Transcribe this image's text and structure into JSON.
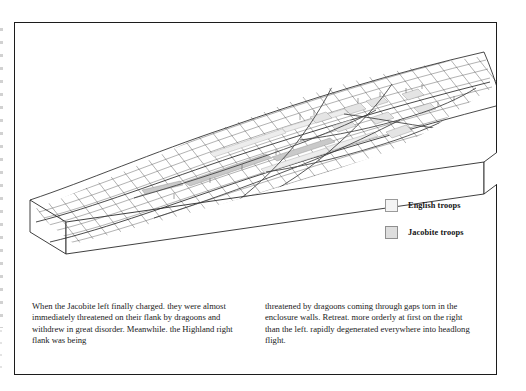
{
  "figure": {
    "kind": "3d-block-terrain-diagram",
    "background_color": "#ffffff",
    "frame_color": "#1c1c1c"
  },
  "legend": {
    "items": [
      {
        "id": "english-troops",
        "label": "English troops",
        "swatch_fill": "#f4f4f4",
        "swatch_border": "#9a9a9a"
      },
      {
        "id": "jacobite-troops",
        "label": "Jacobite troops",
        "swatch_fill": "#dedede",
        "swatch_border": "#8f8f8f"
      }
    ]
  },
  "caption": {
    "left_column": "When the Jacobite left finally charged. they were almost immediately threatened on their flank by dragoons and withdrew in great disorder. Meanwhile. the Highland right flank was being",
    "right_column": "threatened by dragoons coming through gaps torn in the enclosure walls. Retreat. more orderly at first on the right than the left. rapidly degenerated everywhere into headlong flight."
  },
  "terrain": {
    "mesh_line_color": "#3a3a3a",
    "block_edge_color": "#2a2a2a",
    "block_side_fill": "#ffffff",
    "grid_cols": 34,
    "grid_rows": 11,
    "troop_fill_english": "#efefef",
    "troop_fill_jacobite": "#c9c9c9",
    "route_color": "#4a4a4a"
  }
}
